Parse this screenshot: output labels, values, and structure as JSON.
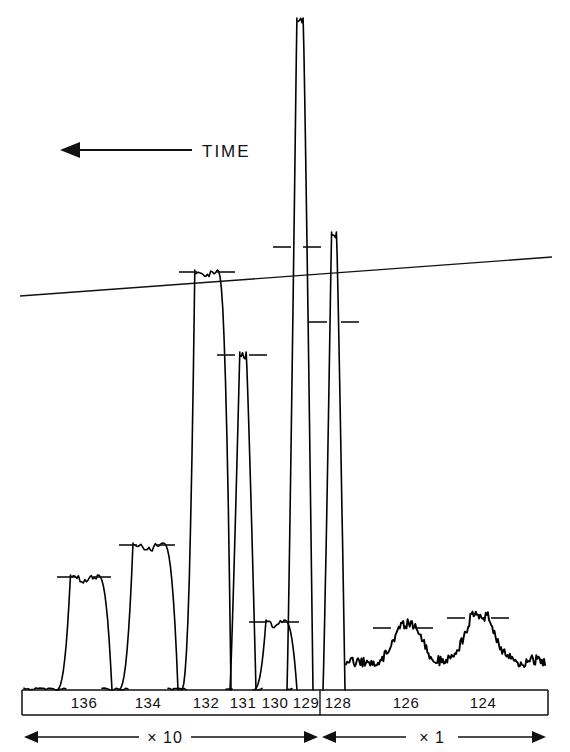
{
  "figure": {
    "title": "",
    "time_annotation": "TIME",
    "time_arrow_direction": "left"
  },
  "axis": {
    "labels": [
      "136",
      "134",
      "132",
      "131",
      "130",
      "129",
      "128",
      "126",
      "124"
    ],
    "label_x": [
      84,
      148,
      206,
      243,
      275,
      306,
      338,
      406,
      483
    ],
    "divider_x": 320
  },
  "ranges": [
    {
      "label": "× 10",
      "x_start": 24,
      "x_end": 318,
      "center": 165
    },
    {
      "label": "× 1",
      "x_start": 322,
      "x_end": 546,
      "center": 432
    }
  ],
  "chart_data": {
    "type": "line",
    "title": "",
    "xlabel": "",
    "ylabel": "",
    "x_tick_labels": [
      "136",
      "134",
      "132",
      "131",
      "130",
      "129",
      "128",
      "126",
      "124"
    ],
    "grid": false,
    "legend": false,
    "annotations": [
      "TIME",
      "× 10",
      "× 1"
    ],
    "baseline_y": 690,
    "peaks": [
      {
        "mass": "136",
        "center_x": 84,
        "top_y": 575,
        "half_width": 18,
        "amplitude": 115,
        "shape": "flat-top",
        "sensitivity": "×10",
        "marker_tick": true
      },
      {
        "mass": "134",
        "center_x": 148,
        "top_y": 543,
        "half_width": 20,
        "amplitude": 147,
        "shape": "flat-top",
        "sensitivity": "×10",
        "marker_tick": true
      },
      {
        "mass": "132",
        "center_x": 206,
        "top_y": 270,
        "half_width": 15,
        "amplitude": 420,
        "shape": "flat-top",
        "sensitivity": "×10",
        "marker_tick": true
      },
      {
        "mass": "131",
        "center_x": 243,
        "top_y": 352,
        "half_width": 9,
        "amplitude": 338,
        "shape": "sharp",
        "sensitivity": "×10",
        "marker_tick": true
      },
      {
        "mass": "130",
        "center_x": 275,
        "top_y": 620,
        "half_width": 12,
        "amplitude": 70,
        "shape": "flat-top",
        "sensitivity": "×10",
        "marker_tick": true
      },
      {
        "mass": "129",
        "center_x": 300,
        "top_y": 18,
        "half_width": 9,
        "amplitude": 672,
        "shape": "sharp",
        "sensitivity": "×10",
        "marker_tick": true
      },
      {
        "mass": "128",
        "center_x": 334,
        "top_y": 232,
        "half_width": 7,
        "amplitude": 458,
        "shape": "sharp",
        "sensitivity": "×1",
        "marker_tick": true
      },
      {
        "mass": "126",
        "center_x": 408,
        "top_y": 624,
        "half_width": 16,
        "amplitude": 36,
        "shape": "noisy",
        "sensitivity": "×1",
        "marker_tick": true
      },
      {
        "mass": "124",
        "center_x": 480,
        "top_y": 616,
        "half_width": 18,
        "amplitude": 44,
        "shape": "noisy",
        "sensitivity": "×1",
        "marker_tick": true
      }
    ],
    "baseline_drift": {
      "x_start": 20,
      "y_start": 296,
      "x_end": 552,
      "y_end": 257
    },
    "height_ticks": [
      {
        "x": 66,
        "y": 577
      },
      {
        "x": 102,
        "y": 577
      },
      {
        "x": 128,
        "y": 545
      },
      {
        "x": 166,
        "y": 545
      },
      {
        "x": 188,
        "y": 272
      },
      {
        "x": 226,
        "y": 272
      },
      {
        "x": 226,
        "y": 355
      },
      {
        "x": 258,
        "y": 355
      },
      {
        "x": 258,
        "y": 622
      },
      {
        "x": 290,
        "y": 622
      },
      {
        "x": 282,
        "y": 247
      },
      {
        "x": 312,
        "y": 247
      },
      {
        "x": 318,
        "y": 322
      },
      {
        "x": 350,
        "y": 322
      },
      {
        "x": 382,
        "y": 628
      },
      {
        "x": 424,
        "y": 628
      },
      {
        "x": 456,
        "y": 618
      },
      {
        "x": 500,
        "y": 618
      }
    ]
  }
}
